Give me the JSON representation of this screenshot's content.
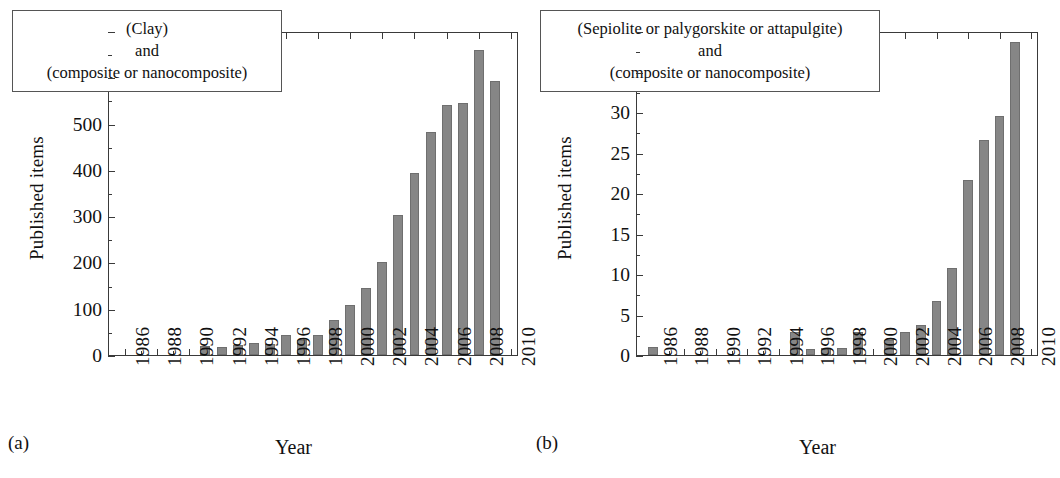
{
  "figure": {
    "panels": [
      {
        "letter": "(a)",
        "caption_lines": [
          "(Clay)",
          "and",
          "(composite or nanocomposite)"
        ],
        "ylabel": "Published items",
        "xlabel": "Year"
      },
      {
        "letter": "(b)",
        "caption_lines": [
          "(Sepiolite or palygorskite or attapulgite)",
          "and",
          "(composite or nanocomposite)"
        ],
        "ylabel": "Published items",
        "xlabel": "Year"
      }
    ],
    "colors": {
      "bar_fill": "#868686",
      "bar_stroke": "#6f6f6f",
      "axis": "#3a3a3a",
      "text": "#111111",
      "background": "#ffffff"
    }
  },
  "chart_data": [
    {
      "type": "bar",
      "title": "(Clay) and (composite or nanocomposite)",
      "panel": "(a)",
      "xlabel": "Year",
      "ylabel": "Published items",
      "xlim": [
        1985,
        2010.5
      ],
      "ylim": [
        0,
        700
      ],
      "yticks": [
        0,
        100,
        200,
        300,
        400,
        500,
        600,
        700
      ],
      "ytick_labels": [
        "0",
        "100",
        "200",
        "300",
        "400",
        "500",
        "600",
        "700"
      ],
      "xticks": [
        1986,
        1988,
        1990,
        1992,
        1994,
        1996,
        1998,
        2000,
        2002,
        2004,
        2006,
        2008,
        2010
      ],
      "xtick_labels": [
        "1986",
        "1988",
        "1990",
        "1992",
        "1994",
        "1996",
        "1998",
        "2000",
        "2002",
        "2004",
        "2006",
        "2008",
        "2010"
      ],
      "grid": false,
      "legend": "none",
      "categories": [
        1986,
        1987,
        1988,
        1989,
        1990,
        1991,
        1992,
        1993,
        1994,
        1995,
        1996,
        1997,
        1998,
        1999,
        2000,
        2001,
        2002,
        2003,
        2004,
        2005,
        2006,
        2007,
        2008,
        2009
      ],
      "values": [
        0,
        0,
        0,
        0,
        0,
        20,
        17,
        22,
        26,
        23,
        43,
        33,
        44,
        76,
        107,
        145,
        201,
        303,
        393,
        481,
        540,
        544,
        658,
        593
      ]
    },
    {
      "type": "bar",
      "title": "(Sepiolite or palygorskite or attapulgite) and (composite or nanocomposite)",
      "panel": "(b)",
      "xlabel": "Year",
      "ylabel": "Published items",
      "xlim": [
        1985,
        2010.5
      ],
      "ylim": [
        0,
        40
      ],
      "yticks": [
        0,
        5,
        10,
        15,
        20,
        25,
        30,
        35,
        40
      ],
      "ytick_labels": [
        "0",
        "5",
        "10",
        "15",
        "20",
        "25",
        "30",
        "35",
        "40"
      ],
      "xticks": [
        1986,
        1988,
        1990,
        1992,
        1994,
        1996,
        1998,
        2000,
        2002,
        2004,
        2006,
        2008,
        2010
      ],
      "xtick_labels": [
        "1986",
        "1988",
        "1990",
        "1992",
        "1994",
        "1996",
        "1998",
        "2000",
        "2002",
        "2004",
        "2006",
        "2008",
        "2010"
      ],
      "grid": false,
      "legend": "none",
      "categories": [
        1986,
        1987,
        1988,
        1989,
        1990,
        1991,
        1992,
        1993,
        1994,
        1995,
        1996,
        1997,
        1998,
        1999,
        2000,
        2001,
        2002,
        2003,
        2004,
        2005,
        2006,
        2007,
        2008,
        2009
      ],
      "values": [
        1.0,
        0,
        0,
        0,
        0,
        0,
        0,
        0,
        0,
        2.9,
        0.8,
        0.9,
        0.9,
        2.8,
        0,
        1.8,
        2.8,
        3.7,
        6.7,
        10.7,
        21.6,
        26.6,
        29.5,
        38.6
      ]
    }
  ]
}
